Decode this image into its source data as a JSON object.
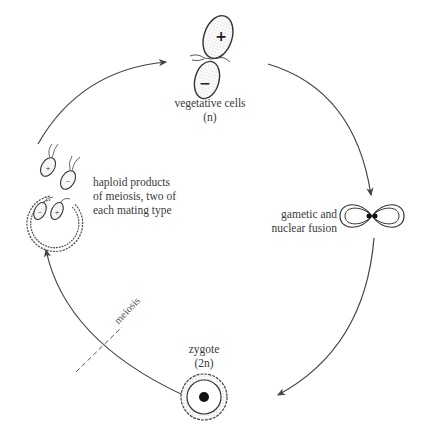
{
  "diagram": {
    "type": "life-cycle",
    "stages": [
      {
        "id": "vegetative",
        "label": "vegetative cells",
        "sublabel": "(n)",
        "marks": [
          "+",
          "−"
        ]
      },
      {
        "id": "fusion",
        "label_lines": [
          "gametic and",
          "nuclear fusion"
        ]
      },
      {
        "id": "zygote",
        "label": "zygote",
        "sublabel": "(2n)"
      },
      {
        "id": "haploid",
        "label_lines": [
          "haploid products",
          "of meiosis, two of",
          "each mating type"
        ],
        "marks": [
          "+",
          "−",
          "−",
          "+"
        ]
      }
    ],
    "transition_label": "meiosis",
    "colors": {
      "line": "#444444",
      "stipple": "#cfcfcf",
      "nucleus": "#111111"
    }
  }
}
